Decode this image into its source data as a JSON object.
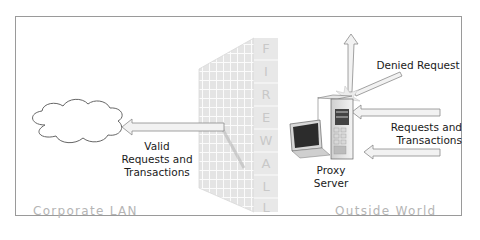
{
  "diagram": {
    "firewall_letters": [
      "F",
      "I",
      "R",
      "E",
      "W",
      "A",
      "L",
      "L"
    ],
    "labels": {
      "valid": [
        "Valid",
        "Requests and",
        "Transactions"
      ],
      "denied": "Denied Request",
      "requests": [
        "Requests and",
        "Transactions"
      ],
      "proxy": [
        "Proxy",
        "Server"
      ]
    },
    "zones": {
      "left": "Corporate LAN",
      "right": "Outside World"
    },
    "nodes": [
      {
        "id": "corporate-lan-cloud",
        "type": "cloud"
      },
      {
        "id": "firewall",
        "type": "wall"
      },
      {
        "id": "proxy-server",
        "type": "server"
      }
    ],
    "edges": [
      {
        "from": "outside-world",
        "to": "proxy-server",
        "label": "Requests and Transactions"
      },
      {
        "from": "proxy-server",
        "to": "corporate-lan-cloud",
        "label": "Valid Requests and Transactions"
      },
      {
        "from": "outside-world",
        "to": "proxy-server",
        "label": "Denied Request",
        "result": "deflected"
      }
    ],
    "colors": {
      "border": "#9a9a9a",
      "wall": "#e6e6e6",
      "wall_lines": "#ffffff",
      "arrow_fill": "#f2f2f2",
      "arrow_stroke": "#8a8a8a",
      "zone_text": "#b5b5b5"
    }
  }
}
